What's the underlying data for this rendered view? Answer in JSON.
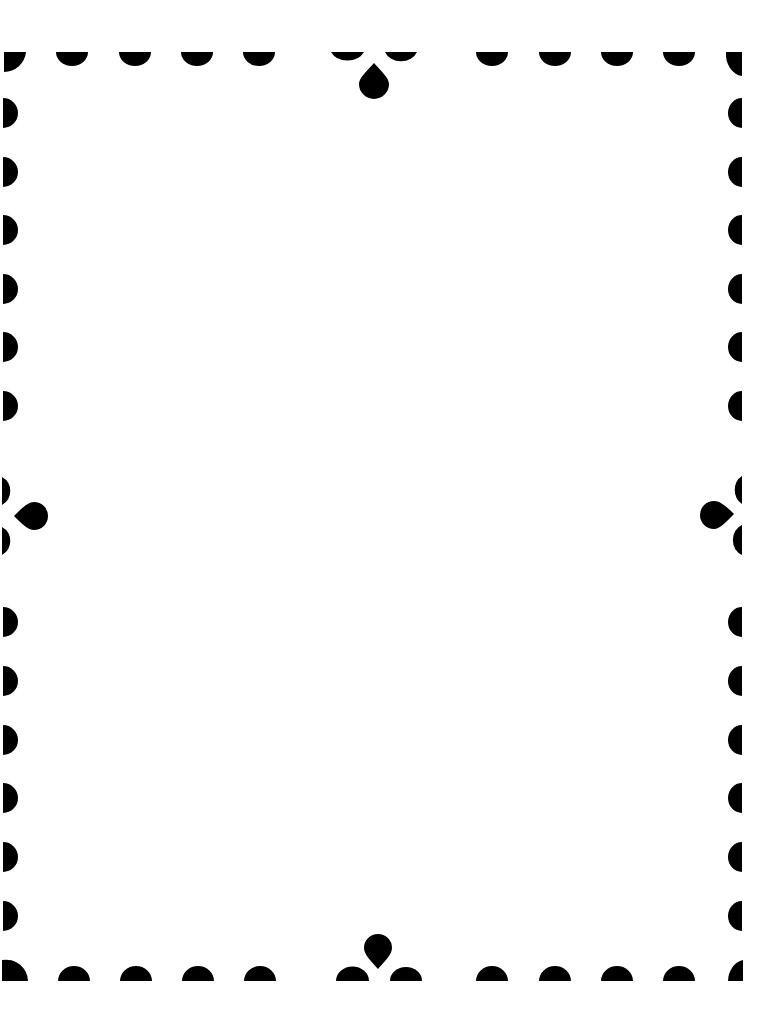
{
  "page": {
    "background": "#ffffff",
    "ink": "#000000"
  },
  "frame": {
    "top_row_scallops_x": [
      72,
      135,
      197,
      259,
      492,
      555,
      617,
      679
    ],
    "bottom_row_scallops_x": [
      74,
      136,
      198,
      260,
      492,
      555,
      617,
      679
    ],
    "left_col_scallops_y": [
      113,
      172,
      230,
      289,
      347,
      406,
      622,
      681,
      740,
      798,
      857,
      916
    ],
    "right_col_scallops_y": [
      113,
      172,
      230,
      289,
      347,
      406,
      622,
      681,
      740,
      798,
      857,
      916
    ],
    "ornaments": [
      "top-center",
      "bottom-center",
      "left-middle",
      "right-middle"
    ]
  }
}
